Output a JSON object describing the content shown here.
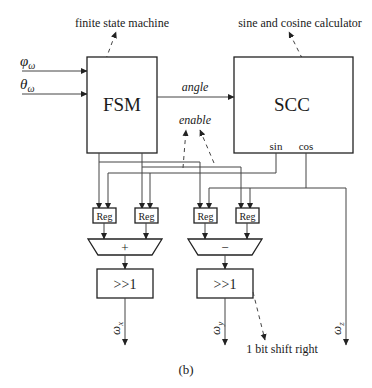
{
  "blocks": {
    "fsm": {
      "label": "FSM",
      "annotation": "finite state machine"
    },
    "scc": {
      "label": "SCC",
      "annotation": "sine and cosine calculator",
      "port_sin": "sin",
      "port_cos": "cos"
    },
    "registers": [
      "Reg",
      "Reg",
      "Reg",
      "Reg"
    ],
    "adder": {
      "op": "+"
    },
    "subtractor": {
      "op": "−"
    },
    "shift_left": {
      "label": ">>1"
    },
    "shift_right": {
      "label": ">>1",
      "annotation": "1 bit shift right"
    }
  },
  "inputs": {
    "phi": {
      "symbol": "φ",
      "sub": "ω"
    },
    "theta": {
      "symbol": "θ",
      "sub": "ω"
    }
  },
  "signals": {
    "angle": "angle",
    "enable": "enable"
  },
  "outputs": {
    "x": {
      "symbol": "ω",
      "sub": "x"
    },
    "y": {
      "symbol": "ω",
      "sub": "y"
    },
    "z": {
      "symbol": "ω",
      "sub": "z"
    }
  },
  "caption": "(b)"
}
